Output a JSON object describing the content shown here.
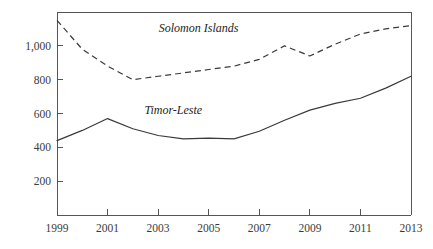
{
  "chart_data": {
    "type": "line",
    "title": "",
    "subtitle": "",
    "xlabel": "",
    "ylabel": "",
    "xlim": [
      1999,
      2013
    ],
    "ylim": [
      0,
      1200
    ],
    "grid": false,
    "legend_position": "inline-annotations",
    "x": [
      1999,
      2000,
      2001,
      2002,
      2003,
      2004,
      2005,
      2006,
      2007,
      2008,
      2009,
      2010,
      2011,
      2012,
      2013
    ],
    "xtick_labels": [
      "1999",
      "2001",
      "2003",
      "2005",
      "2007",
      "2009",
      "2011",
      "2013"
    ],
    "xtick_values": [
      1999,
      2001,
      2003,
      2005,
      2007,
      2009,
      2011,
      2013
    ],
    "ytick_labels": [
      "200",
      "400",
      "600",
      "800",
      "1,000"
    ],
    "ytick_values": [
      200,
      400,
      600,
      800,
      1000
    ],
    "series": [
      {
        "name": "Solomon Islands",
        "style": "dashed",
        "values": [
          1150,
          980,
          880,
          800,
          820,
          840,
          860,
          880,
          920,
          1000,
          940,
          1010,
          1070,
          1100,
          1120
        ]
      },
      {
        "name": "Timor-Leste",
        "style": "solid",
        "values": [
          440,
          500,
          570,
          510,
          470,
          450,
          455,
          450,
          495,
          560,
          620,
          660,
          690,
          750,
          820
        ]
      }
    ],
    "annotations": [
      {
        "text": "Solomon Islands",
        "x": 2004.6,
        "y": 1080
      },
      {
        "text": "Timor-Leste",
        "x": 2003.6,
        "y": 600
      }
    ]
  },
  "axes": {
    "y_axis_name": "value-axis",
    "x_axis_name": "year-axis"
  }
}
